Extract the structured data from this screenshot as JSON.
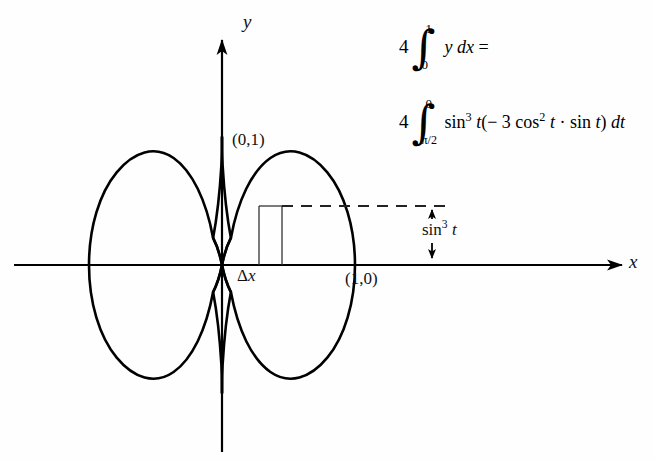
{
  "figure": {
    "type": "astroid-area-diagram",
    "axes": {
      "x_label": "x",
      "y_label": "y",
      "x_axis_arrow": true,
      "y_axis_arrow": true
    },
    "curve": {
      "name": "astroid",
      "equation_parametric": "x = cos^3 t, y = sin^3 t",
      "cusps": [
        "(0,1)",
        "(1,0)",
        "(0,-1)",
        "(-1,0)"
      ]
    },
    "point_labels": [
      {
        "text": "(0,1)",
        "position": "top-cusp"
      },
      {
        "text": "(1,0)",
        "position": "right-cusp"
      }
    ],
    "strip": {
      "label": "Δx",
      "label_delta": "Δ",
      "label_var": "x",
      "description": "vertical rectangular strip in first quadrant"
    },
    "dashed_line": {
      "present": true,
      "description": "horizontal dashed line from strip top to arrow"
    },
    "height_annotation": {
      "label_base": "sin",
      "label_exponent": "3",
      "label_var": "t",
      "full_text": "sin³ t",
      "arrow": "double-headed vertical"
    }
  },
  "equations": [
    {
      "id": "eq-1",
      "coefficient": "4",
      "integral_upper": "1",
      "integral_lower": "0",
      "integrand_var": "y",
      "integrand_diff": "dx",
      "trailing": "=",
      "full_text": "4 ∫₀¹ y dx ="
    },
    {
      "id": "eq-2",
      "coefficient": "4",
      "integral_upper": "0",
      "integral_lower": "π/2",
      "integrand_full": "sin³ t( − 3 cos² t · sin t) dt",
      "sin_base": "sin",
      "sin_exp": "3",
      "var_t": "t",
      "open_paren": "(",
      "minus": "−",
      "three": "3",
      "cos_base": "cos",
      "cos_exp": "2",
      "dot": "·",
      "sin_base_2": "sin",
      "close_paren": ")",
      "diff": "dt",
      "full_text": "4 ∫₀^{π/2} sin³ t(−3 cos² t · sin t) dt"
    }
  ],
  "colors": {
    "ink": "#111111",
    "background": "#fefefe",
    "curve": "#000000",
    "dashed": "#222222"
  }
}
